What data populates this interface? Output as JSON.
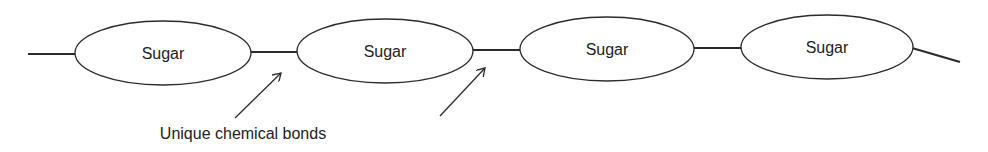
{
  "diagram": {
    "type": "polysaccharide-chain",
    "units": [
      {
        "label": "Sugar",
        "cx": 163,
        "cy": 53
      },
      {
        "label": "Sugar",
        "cx": 385,
        "cy": 51
      },
      {
        "label": "Sugar",
        "cx": 607,
        "cy": 49
      },
      {
        "label": "Sugar",
        "cx": 827,
        "cy": 47
      }
    ],
    "annotation": {
      "label": "Unique chemical bonds",
      "points_to": [
        "bond between sugar 1 and sugar 2",
        "bond between sugar 2 and sugar 3"
      ]
    },
    "colors": {
      "stroke": "#2b2b2b",
      "text": "#222222",
      "background": "#ffffff"
    }
  }
}
